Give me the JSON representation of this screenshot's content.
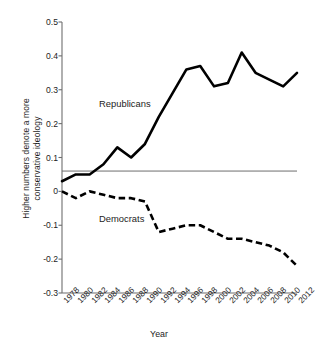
{
  "chart_data": {
    "type": "line",
    "title": "",
    "xlabel": "Year",
    "ylabel": "Higher numbers denote a more\nconservative ideology",
    "x": [
      1978,
      1980,
      1982,
      1984,
      1986,
      1988,
      1990,
      1992,
      1994,
      1996,
      1998,
      2000,
      2002,
      2004,
      2006,
      2008,
      2010,
      2012
    ],
    "categories": [
      "1978",
      "1980",
      "1982",
      "1984",
      "1986",
      "1988",
      "1990",
      "1992",
      "1994",
      "1996",
      "1998",
      "2000",
      "2002",
      "2004",
      "2006",
      "2008",
      "2010",
      "2012"
    ],
    "xtick_labels": [
      "1978",
      "1980",
      "1982",
      "1984",
      "1986",
      "1988",
      "1990",
      "1992",
      "1994",
      "1996",
      "1998",
      "2000",
      "2002",
      "2004",
      "2006",
      "2008",
      "2010",
      "2012"
    ],
    "ytick_labels": [
      "0.5",
      "0.4",
      "0.3",
      "0.2",
      "0.1",
      "0",
      "-0.1",
      "-0.2",
      "-0.3"
    ],
    "ytick_values": [
      0.5,
      0.4,
      0.3,
      0.2,
      0.1,
      0,
      -0.1,
      -0.2,
      -0.3
    ],
    "ylim": [
      -0.3,
      0.5
    ],
    "xlim": [
      1978,
      2012
    ],
    "grid": false,
    "legend": "inline-annotation",
    "reference_line": {
      "orientation": "horizontal",
      "value": 0.06,
      "color": "#6e6e6e"
    },
    "series": [
      {
        "name": "Republicans",
        "style": "solid",
        "color": "#000000",
        "values": [
          0.03,
          0.05,
          0.05,
          0.08,
          0.13,
          0.1,
          0.14,
          0.22,
          0.29,
          0.36,
          0.37,
          0.31,
          0.32,
          0.41,
          0.35,
          0.33,
          0.31,
          0.35
        ]
      },
      {
        "name": "Democrats",
        "style": "dashed",
        "color": "#000000",
        "values": [
          0.0,
          -0.02,
          0.0,
          -0.01,
          -0.02,
          -0.02,
          -0.03,
          -0.12,
          -0.11,
          -0.1,
          -0.1,
          -0.12,
          -0.14,
          -0.14,
          -0.15,
          -0.16,
          -0.18,
          -0.22
        ]
      }
    ],
    "annotations": [
      {
        "text": "Republicans",
        "x": 1986,
        "y": 0.23
      },
      {
        "text": "Democrats",
        "x": 1986,
        "y": -0.12
      }
    ]
  },
  "axis": {
    "x_title": "Year",
    "y_title": "Higher numbers denote a more\nconservative ideology"
  }
}
